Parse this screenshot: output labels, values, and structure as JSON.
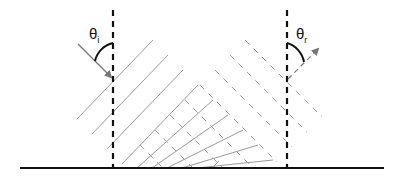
{
  "labels": {
    "incident_angle": {
      "symbol": "θ",
      "subscript": "i"
    },
    "reflected_angle": {
      "symbol": "θ",
      "subscript": "r"
    }
  },
  "elements": {
    "surface": "reflecting surface (solid baseline)",
    "normals": [
      "normal at incidence point (dashed)",
      "normal at reflection point (dashed)"
    ],
    "incident_ray": "incident ray with arrow",
    "reflected_ray": "reflected ray with arrow (dashed)",
    "incident_wavefronts": "solid parallel wavefronts",
    "reflected_wavefronts": "dashed parallel wavefronts"
  },
  "colors": {
    "line_dark": "#111111",
    "wavefront_gray": "#9a9a9a",
    "arrow_gray": "#777777"
  }
}
